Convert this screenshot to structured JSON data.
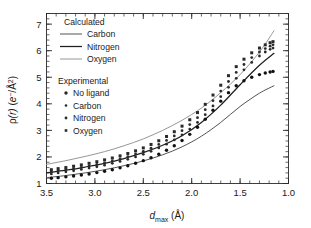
{
  "chart_data": {
    "type": "line",
    "title": "",
    "xlabel": "d_max (Å)",
    "ylabel": "ρ(r) (e⁻/Å²)",
    "xlim": [
      3.5,
      1.0
    ],
    "ylim": [
      1.0,
      7.4
    ],
    "x_axis_reversed": true,
    "xticks": [
      3.5,
      3.0,
      2.5,
      2.0,
      1.5,
      1.0
    ],
    "xticklabels": [
      "3.5",
      "3.0",
      "2.5",
      "2.0",
      "1.5",
      "1.0"
    ],
    "x_minor_step": 0.1,
    "yticks": [
      1,
      2,
      3,
      4,
      5,
      6,
      7
    ],
    "yticklabels": [
      "1",
      "2",
      "3",
      "4",
      "5",
      "6",
      "7"
    ],
    "y_minor_step": 0.2,
    "grid": false,
    "legend_position": "upper-left-inside",
    "series": [
      {
        "name": "Oxygen",
        "group": "Calculated",
        "kind": "line",
        "color": "#8a8a8a",
        "width": 0.9,
        "x": [
          3.5,
          3.3,
          3.1,
          2.9,
          2.7,
          2.5,
          2.3,
          2.1,
          1.9,
          1.7,
          1.5,
          1.3,
          1.15
        ],
        "y": [
          1.72,
          1.86,
          2.02,
          2.2,
          2.42,
          2.68,
          3.0,
          3.38,
          3.84,
          4.42,
          5.1,
          5.95,
          6.75
        ]
      },
      {
        "name": "Nitrogen",
        "group": "Calculated",
        "kind": "line",
        "color": "#1f1f1f",
        "width": 1.25,
        "x": [
          3.5,
          3.3,
          3.1,
          2.9,
          2.7,
          2.5,
          2.3,
          2.1,
          1.9,
          1.7,
          1.5,
          1.3,
          1.15
        ],
        "y": [
          1.4,
          1.5,
          1.62,
          1.76,
          1.94,
          2.16,
          2.44,
          2.8,
          3.3,
          3.95,
          4.72,
          5.45,
          5.9
        ]
      },
      {
        "name": "Carbon",
        "group": "Calculated",
        "kind": "line",
        "color": "#4a4a4a",
        "width": 0.95,
        "x": [
          3.5,
          3.3,
          3.1,
          2.9,
          2.7,
          2.5,
          2.3,
          2.1,
          1.9,
          1.7,
          1.5,
          1.3,
          1.15
        ],
        "y": [
          1.22,
          1.3,
          1.4,
          1.52,
          1.67,
          1.85,
          2.08,
          2.38,
          2.78,
          3.3,
          3.9,
          4.4,
          4.68
        ]
      },
      {
        "name": "Oxygen",
        "group": "Experimental",
        "kind": "scatter",
        "marker": "square-dot",
        "color": "#2a2a2a",
        "size": 1.5,
        "x": [
          3.45,
          3.38,
          3.3,
          3.22,
          3.14,
          3.06,
          2.98,
          2.9,
          2.82,
          2.74,
          2.66,
          2.58,
          2.5,
          2.42,
          2.34,
          2.26,
          2.18,
          2.1,
          2.02,
          1.94,
          1.86,
          1.78,
          1.7,
          1.62,
          1.54,
          1.46,
          1.38,
          1.3,
          1.24,
          1.19,
          1.16
        ],
        "y": [
          1.52,
          1.56,
          1.6,
          1.65,
          1.7,
          1.76,
          1.82,
          1.89,
          1.96,
          2.04,
          2.13,
          2.23,
          2.34,
          2.47,
          2.61,
          2.77,
          2.95,
          3.16,
          3.4,
          3.67,
          3.98,
          4.33,
          4.7,
          5.06,
          5.4,
          5.68,
          5.92,
          6.1,
          6.22,
          6.3,
          6.34
        ]
      },
      {
        "name": "Nitrogen",
        "group": "Experimental",
        "kind": "scatter",
        "marker": "dot",
        "color": "#2a2a2a",
        "size": 1.4,
        "x": [
          3.45,
          3.38,
          3.3,
          3.22,
          3.14,
          3.06,
          2.98,
          2.9,
          2.82,
          2.74,
          2.66,
          2.58,
          2.5,
          2.42,
          2.34,
          2.26,
          2.18,
          2.1,
          2.02,
          1.94,
          1.86,
          1.78,
          1.7,
          1.62,
          1.54,
          1.46,
          1.38,
          1.3,
          1.24,
          1.19,
          1.16
        ],
        "y": [
          1.44,
          1.48,
          1.52,
          1.56,
          1.61,
          1.66,
          1.72,
          1.78,
          1.85,
          1.93,
          2.01,
          2.11,
          2.21,
          2.33,
          2.47,
          2.62,
          2.79,
          2.99,
          3.22,
          3.48,
          3.78,
          4.12,
          4.48,
          4.84,
          5.18,
          5.48,
          5.74,
          5.95,
          6.08,
          6.17,
          6.22
        ]
      },
      {
        "name": "Carbon",
        "group": "Experimental",
        "kind": "scatter",
        "marker": "dot",
        "color": "#2a2a2a",
        "size": 1.4,
        "x": [
          3.45,
          3.38,
          3.3,
          3.22,
          3.14,
          3.06,
          2.98,
          2.9,
          2.82,
          2.74,
          2.66,
          2.58,
          2.5,
          2.42,
          2.34,
          2.26,
          2.18,
          2.1,
          2.02,
          1.94,
          1.86,
          1.78,
          1.7,
          1.62,
          1.54,
          1.46,
          1.38,
          1.3,
          1.24,
          1.19,
          1.16
        ],
        "y": [
          1.36,
          1.4,
          1.44,
          1.48,
          1.53,
          1.58,
          1.63,
          1.69,
          1.76,
          1.83,
          1.91,
          2.0,
          2.1,
          2.21,
          2.34,
          2.48,
          2.64,
          2.83,
          3.05,
          3.3,
          3.59,
          3.92,
          4.27,
          4.62,
          4.96,
          5.28,
          5.56,
          5.8,
          5.95,
          6.05,
          6.1
        ]
      },
      {
        "name": "No ligand",
        "group": "Experimental",
        "kind": "scatter",
        "marker": "dot-large",
        "color": "#111111",
        "size": 1.7,
        "x": [
          3.45,
          3.38,
          3.3,
          3.22,
          3.14,
          3.06,
          2.98,
          2.9,
          2.82,
          2.74,
          2.66,
          2.58,
          2.5,
          2.42,
          2.34,
          2.26,
          2.18,
          2.1,
          2.02,
          1.94,
          1.86,
          1.78,
          1.7,
          1.62,
          1.54,
          1.46,
          1.38,
          1.3,
          1.24,
          1.19,
          1.16
        ],
        "y": [
          1.2,
          1.22,
          1.25,
          1.28,
          1.32,
          1.36,
          1.41,
          1.46,
          1.52,
          1.59,
          1.67,
          1.76,
          1.86,
          1.97,
          2.1,
          2.25,
          2.42,
          2.62,
          2.85,
          3.12,
          3.42,
          3.76,
          4.1,
          4.42,
          4.68,
          4.87,
          5.0,
          5.1,
          5.16,
          5.2,
          5.22
        ]
      }
    ]
  },
  "legend": {
    "calculated_header": "Calculated",
    "calculated_items": [
      {
        "label": "Carbon"
      },
      {
        "label": "Nitrogen"
      },
      {
        "label": "Oxygen"
      }
    ],
    "experimental_header": "Experimental",
    "experimental_items": [
      {
        "label": "No ligand"
      },
      {
        "label": "Carbon"
      },
      {
        "label": "Nitrogen"
      },
      {
        "label": "Oxygen"
      }
    ]
  },
  "axes": {
    "y_label_rho": "ρ",
    "y_label_r": "(r)",
    "y_label_units_open": " (",
    "y_label_e": "e",
    "y_label_eminus": "−",
    "y_label_slash": "/Å",
    "y_label_sq": "2",
    "y_label_units_close": ")",
    "x_label_d": "d",
    "x_label_max": "max",
    "x_label_unit": "(Å)"
  },
  "colors": {
    "axis": "#2a2a2a",
    "oxygen_line": "#8a8a8a",
    "nitrogen_line": "#1f1f1f",
    "carbon_line": "#4a4a4a",
    "marker": "#2a2a2a"
  }
}
